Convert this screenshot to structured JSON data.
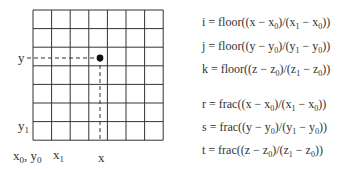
{
  "diagram": {
    "grid": {
      "left": 33,
      "top": 10,
      "cols": 7,
      "rows": 7,
      "cell": 18.6,
      "line_color": "#333333"
    },
    "point": {
      "cx": 100,
      "cy": 58,
      "r": 3.4,
      "color": "#111111"
    },
    "axis_labels": {
      "y": "y",
      "y1": "y",
      "y1_sub": "1",
      "x0": "x",
      "x0_sub": "0",
      "y0": "y",
      "y0_sub": "0",
      "x1": "x",
      "x1_sub": "1",
      "x": "x"
    }
  },
  "equations": [
    {
      "lhs": "i",
      "fn": "floor",
      "v": "x"
    },
    {
      "lhs": "j",
      "fn": "floor",
      "v": "y"
    },
    {
      "lhs": "k",
      "fn": "floor",
      "v": "z"
    },
    {
      "lhs": "r",
      "fn": "frac",
      "v": "x"
    },
    {
      "lhs": "s",
      "fn": "frac",
      "v": "y"
    },
    {
      "lhs": "t",
      "fn": "frac",
      "v": "z"
    }
  ]
}
